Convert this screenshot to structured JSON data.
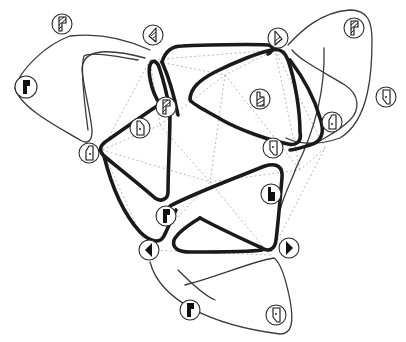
{
  "diagram": {
    "type": "tiling-loop-diagram",
    "colors": {
      "thick_loop": "#1a1a1a",
      "thin_loop": "#3a3a3a",
      "faint_edge": "#a8a8a8",
      "background": "#ffffff"
    },
    "loops": {
      "thick": [
        {
          "id": "left-inner",
          "points": "108,143 160,101 163,191 148,197"
        },
        {
          "id": "top-band",
          "points": "160,60 271,47 300,145 291,149"
        },
        {
          "id": "right-upper",
          "points": "182,64 265,43 295,142 208,88"
        },
        {
          "id": "upper-center",
          "points": "156,100 100,150 157,198"
        },
        {
          "id": "right-inner",
          "points": "188,99 270,50 325,143 292,145"
        },
        {
          "id": "lower-left",
          "points": "154,210 272,195 258,240 195,215"
        },
        {
          "id": "lower-right",
          "points": "175,243 225,226 287,248 175,245"
        }
      ],
      "thin": [
        {
          "id": "left-outer",
          "label": "left petal"
        },
        {
          "id": "right-outer",
          "label": "right petal"
        },
        {
          "id": "bottom-outer",
          "label": "bottom petal"
        }
      ]
    },
    "nodes": [
      {
        "id": "n1",
        "x": 62,
        "y": 24,
        "glyph": "hatched-flag"
      },
      {
        "id": "n2",
        "x": 153,
        "y": 35,
        "glyph": "hatched-triangle-left"
      },
      {
        "id": "n3",
        "x": 278,
        "y": 38,
        "glyph": "hatched-triangle-right"
      },
      {
        "id": "n4",
        "x": 354,
        "y": 28,
        "glyph": "hatched-flag"
      },
      {
        "id": "n5",
        "x": 26,
        "y": 87,
        "glyph": "solid-flag"
      },
      {
        "id": "n6",
        "x": 166,
        "y": 107,
        "glyph": "hatched-flag"
      },
      {
        "id": "n7",
        "x": 140,
        "y": 128,
        "glyph": "outline-quad-dot"
      },
      {
        "id": "n8",
        "x": 260,
        "y": 99,
        "glyph": "hatched-notch"
      },
      {
        "id": "n9",
        "x": 386,
        "y": 97,
        "glyph": "outline-quad-dot"
      },
      {
        "id": "n10",
        "x": 332,
        "y": 122,
        "glyph": "outline-quad-dot"
      },
      {
        "id": "n11",
        "x": 89,
        "y": 153,
        "glyph": "outline-quad-dot"
      },
      {
        "id": "n12",
        "x": 273,
        "y": 148,
        "glyph": "outline-quad-dot"
      },
      {
        "id": "n13",
        "x": 271,
        "y": 194,
        "glyph": "solid-notch"
      },
      {
        "id": "n14",
        "x": 166,
        "y": 216,
        "glyph": "solid-flag"
      },
      {
        "id": "n15",
        "x": 149,
        "y": 250,
        "glyph": "solid-triangle-left"
      },
      {
        "id": "n16",
        "x": 289,
        "y": 248,
        "glyph": "solid-triangle-right"
      },
      {
        "id": "n17",
        "x": 190,
        "y": 310,
        "glyph": "solid-flag"
      },
      {
        "id": "n18",
        "x": 276,
        "y": 315,
        "glyph": "outline-quad-dot"
      }
    ]
  }
}
